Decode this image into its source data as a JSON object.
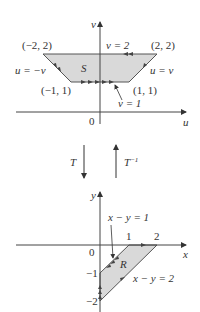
{
  "top_panel": {
    "axis_labels": {
      "horizontal": "u",
      "vertical": "v",
      "origin": "0"
    },
    "region_label": "S",
    "vertices": [
      {
        "label": "(−2, 2)",
        "u": -2,
        "v": 2
      },
      {
        "label": "(2, 2)",
        "u": 2,
        "v": 2
      },
      {
        "label": "(−1, 1)",
        "u": -1,
        "v": 1
      },
      {
        "label": "(1, 1)",
        "u": 1,
        "v": 1
      }
    ],
    "boundary_labels": {
      "top": "v = 2",
      "bottom": "v = 1",
      "left": "u = −v",
      "right": "u = v"
    }
  },
  "transform": {
    "forward": "T",
    "inverse": "T",
    "inverse_sup": "−1"
  },
  "bottom_panel": {
    "axis_labels": {
      "horizontal": "x",
      "vertical": "y",
      "origin": "0"
    },
    "region_label": "R",
    "ticks": {
      "x1": "1",
      "x2": "2",
      "ym1": "−1",
      "ym2": "−2"
    },
    "boundary_labels": {
      "upper": "x − y = 1",
      "lower": "x − y = 2"
    }
  },
  "colors": {
    "region_fill": "#d9d9d9",
    "line": "#333333",
    "axis": "#444444"
  }
}
